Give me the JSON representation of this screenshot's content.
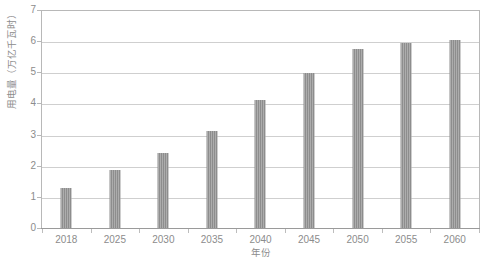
{
  "chart_data": {
    "type": "bar",
    "title": "",
    "xlabel": "年份",
    "ylabel": "用电量（万亿千瓦时）",
    "categories": [
      "2018",
      "2025",
      "2030",
      "2035",
      "2040",
      "2045",
      "2050",
      "2055",
      "2060"
    ],
    "values": [
      1.3,
      1.85,
      2.4,
      3.1,
      4.1,
      4.98,
      5.75,
      5.95,
      6.05
    ],
    "ylim": [
      0,
      7
    ],
    "yticks": [
      0,
      1,
      2,
      3,
      4,
      5,
      6,
      7
    ],
    "ytick_labels": [
      "0",
      "1",
      "2",
      "3",
      "4",
      "5",
      "6",
      "7"
    ],
    "grid": true,
    "legend": "none",
    "series_color": "#8d8d8d",
    "gridline_color": "#cfcfcf",
    "axis_color": "#b8b8b8",
    "text_color": "#8c8c8c"
  },
  "figure": {
    "caption": ""
  }
}
